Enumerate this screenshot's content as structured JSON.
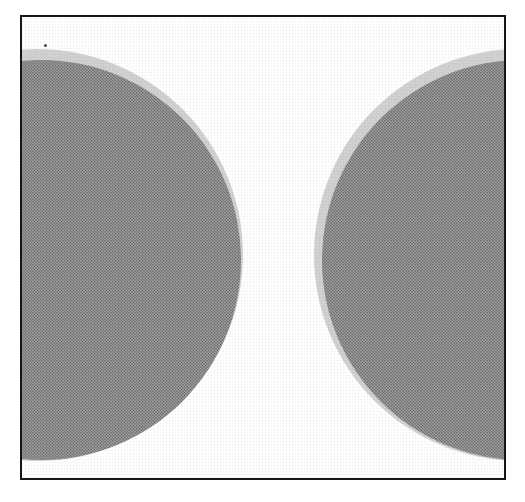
{
  "figure": {
    "media": "scanned halftone line-art figure",
    "canvas": {
      "width": 525,
      "height": 502,
      "background_color": "#ffffff"
    },
    "frame": {
      "name": "rectangular border",
      "left": 20,
      "top": 15,
      "width": 486,
      "height": 465,
      "border_width": 2,
      "border_color": "#161616",
      "fill_color": "#ffffff"
    },
    "palette": {
      "paper_white": "#ffffff",
      "frame_black": "#161616",
      "disc_fill_gray": "#7d7d7d",
      "disc_halo_gray": "#d2d2d2",
      "speck_gray": "#4a4a4a"
    },
    "discs": [
      {
        "id": "left-disc",
        "label": "left disc",
        "clipped_side": "left",
        "center_x": 15,
        "center_y": 238,
        "radius": 200,
        "halo_radius": 206,
        "body_offset_x": 4,
        "body_offset_y": 5,
        "visible_extent_x": [
          7,
          197
        ],
        "visible_extent_y": [
          40,
          437
        ],
        "fill_color": "#7d7d7d",
        "halo_color": "#d2d2d2"
      },
      {
        "id": "right-disc",
        "label": "right disc",
        "clipped_side": "right",
        "center_x": 498,
        "center_y": 238,
        "radius": 200,
        "halo_radius": 206,
        "body_offset_x": 2,
        "body_offset_y": 5,
        "visible_extent_x": [
          298,
          482
        ],
        "visible_extent_y": [
          40,
          437
        ],
        "fill_color": "#7d7d7d",
        "halo_color": "#d2d2d2"
      }
    ],
    "artifacts": [
      {
        "id": "scan-speck",
        "label": "scanner speck",
        "x": 22,
        "y": 27,
        "size": 3,
        "color": "#4a4a4a"
      }
    ],
    "gap": {
      "label": "white gap between discs",
      "left": 197,
      "right": 298,
      "color": "#ffffff"
    }
  }
}
